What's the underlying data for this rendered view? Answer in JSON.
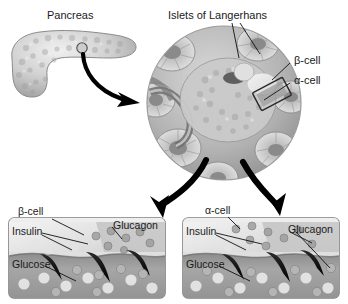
{
  "figure": {
    "type": "biological-diagram",
    "palette": {
      "background": "#ffffff",
      "text": "#1a1a1a",
      "organ_light": "#dcdcdc",
      "organ_mid": "#b8b8b8",
      "organ_dark": "#8e8e8e",
      "islet_light": "#d2d2d2",
      "islet_mid": "#a9a9a9",
      "islet_dark": "#6f6f6f",
      "panel_border": "#8a8a8a",
      "panel_fill": "#d7d7d7",
      "blood_band": "#9a9a9a",
      "blood_band_dark": "#7c7c7c",
      "arrow_black": "#000000",
      "leader_line": "#111111",
      "cell_pale": "#ebebeb",
      "granule": "#b0b0b0"
    }
  },
  "top_left": {
    "organ_label": "Pancreas",
    "marker": "magnification-site-circle",
    "arrow": "curved-arrow-to-islet"
  },
  "top_right": {
    "islet_label": "Islets of Langerhans",
    "beta_label": "β-cell",
    "alpha_label": "α-cell",
    "callout_box": "beta-alpha-cell-detail-box"
  },
  "panels": [
    {
      "id": "left-panel",
      "cell_type_label": "β-cell",
      "labels": [
        "Insulin",
        "Glucagon",
        "Glucose"
      ],
      "arrow_in": "thick-arrow-down-left",
      "secretion_wedges": 3,
      "vessel": "bloodstream-band"
    },
    {
      "id": "right-panel",
      "cell_type_label": "α-cell",
      "labels": [
        "Insulin",
        "Glucagon",
        "Glucose"
      ],
      "arrow_in": "thick-arrow-down-right",
      "secretion_wedges": 3,
      "vessel": "bloodstream-band"
    }
  ]
}
